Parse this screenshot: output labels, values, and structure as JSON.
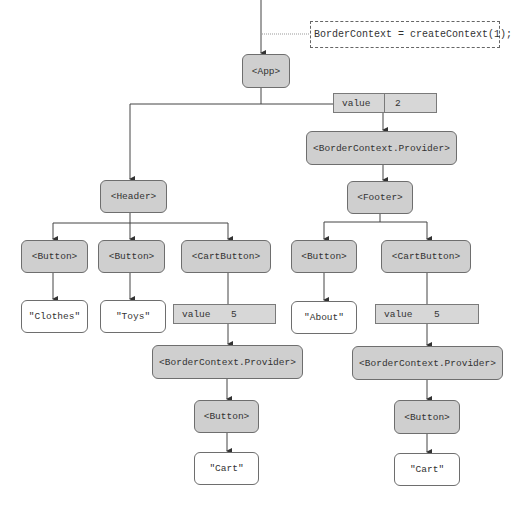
{
  "annotation": {
    "text": "BorderContext = createContext(1);"
  },
  "nodes": {
    "app": "<App>",
    "provider_top": "<BorderContext.Provider>",
    "header": "<Header>",
    "footer": "<Footer>",
    "header_button_1": "<Button>",
    "header_button_2": "<Button>",
    "header_cartbutton": "<CartButton>",
    "footer_button": "<Button>",
    "footer_cartbutton": "<CartButton>",
    "text_clothes": "\"Clothes\"",
    "text_toys": "\"Toys\"",
    "text_about": "\"About\"",
    "provider_left": "<BorderContext.Provider>",
    "provider_right": "<BorderContext.Provider>",
    "cart_button_left": "<Button>",
    "cart_button_right": "<Button>",
    "text_cart_left": "\"Cart\"",
    "text_cart_right": "\"Cart\""
  },
  "values": {
    "top": {
      "key": "value",
      "val": "2"
    },
    "left": {
      "key": "value",
      "val": "5"
    },
    "right": {
      "key": "value",
      "val": "5"
    }
  },
  "colors": {
    "component_fill": "#cfcfcf",
    "text_fill": "#ffffff",
    "value_fill": "#d7d7d7",
    "line": "#444444"
  }
}
